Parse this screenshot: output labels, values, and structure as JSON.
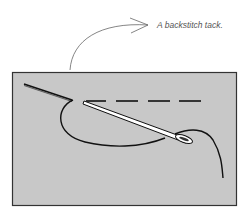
{
  "caption": {
    "text": "A backstitch tack."
  },
  "illustration": {
    "subject": "needle-and-thread-backstitch",
    "colors": {
      "fabric": "#c8c8c8",
      "fabric_border": "#333333",
      "thread": "#111111",
      "needle_fill": "#ffffff",
      "arrow": "#666666"
    },
    "stitch_dash_count": 4
  }
}
